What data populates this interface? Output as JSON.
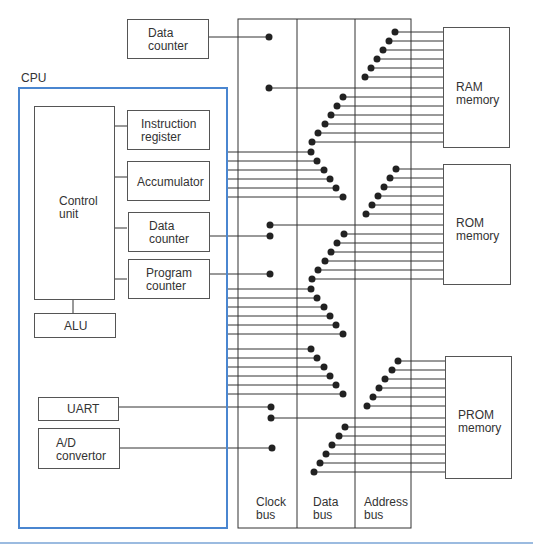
{
  "diagram": {
    "title": "CPU",
    "colors": {
      "cpu_border": "#4a86d0",
      "line": "#333333",
      "dot": "#222222",
      "footer_rule": "#9bbbe0"
    },
    "external_blocks": {
      "data_counter": {
        "line1": "Data",
        "line2": "counter"
      },
      "ram": {
        "line1": "RAM",
        "line2": "memory"
      },
      "rom": {
        "line1": "ROM",
        "line2": "memory"
      },
      "prom": {
        "line1": "PROM",
        "line2": "memory"
      }
    },
    "cpu_blocks": {
      "control_unit": {
        "line1": "Control",
        "line2": "unit"
      },
      "instruction_register": {
        "line1": "Instruction",
        "line2": "register"
      },
      "accumulator": {
        "line1": "Accumulator"
      },
      "data_counter": {
        "line1": "Data",
        "line2": "counter"
      },
      "program_counter": {
        "line1": "Program",
        "line2": "counter"
      },
      "alu": {
        "line1": "ALU"
      },
      "uart": {
        "line1": "UART"
      },
      "ad_convertor": {
        "line1": "A/D",
        "line2": "convertor"
      }
    },
    "buses": [
      {
        "line1": "Clock",
        "line2": "bus"
      },
      {
        "line1": "Data",
        "line2": "bus"
      },
      {
        "line1": "Address",
        "line2": "bus"
      }
    ]
  }
}
